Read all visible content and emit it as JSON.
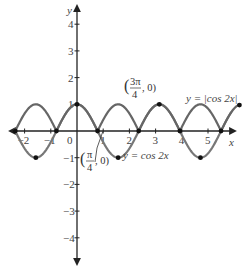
{
  "chart_data": {
    "type": "line",
    "title": "",
    "xlabel": "x",
    "ylabel": "y",
    "xlim": [
      -2.5,
      5.9
    ],
    "ylim": [
      -4.6,
      4.6
    ],
    "x_ticks": [
      -2,
      -1,
      0,
      1,
      2,
      3,
      4,
      5
    ],
    "y_ticks": [
      -4,
      -3,
      -2,
      -1,
      1,
      2,
      3,
      4
    ],
    "grid": false,
    "legend": "none",
    "series": [
      {
        "name": "y = cos 2x",
        "function": "cos(2x)",
        "x_range": [
          -2.4,
          5.9
        ],
        "color": "#777777",
        "marked_points": [
          [
            -3.1416,
            1
          ],
          [
            -1.5708,
            -1
          ],
          [
            0,
            1
          ],
          [
            1.5708,
            -1
          ],
          [
            3.1416,
            1
          ],
          [
            4.7124,
            -1
          ]
        ]
      },
      {
        "name": "y = |cos 2x|",
        "function": "abs(cos(2x))",
        "x_range": [
          -2.4,
          6.2
        ],
        "color": "#666666",
        "marked_points": [
          [
            -2.3562,
            0
          ],
          [
            -0.7854,
            0
          ],
          [
            0.7854,
            0
          ],
          [
            2.3562,
            0
          ],
          [
            3.927,
            0
          ],
          [
            5.4978,
            0
          ],
          [
            6.2,
            0.97
          ]
        ]
      }
    ],
    "annotations": [
      {
        "text": "(3π/4, 0)",
        "num": "3π",
        "den": "4",
        "rest": ", 0)",
        "x": 2.36,
        "y": 1.35
      },
      {
        "text": "(π/4, 0)",
        "num": "π",
        "den": "4",
        "rest": ", 0)",
        "x": 0.5,
        "y": -0.9
      },
      {
        "text": "y = |cos 2x|",
        "x": 4.4,
        "y": 1.1
      },
      {
        "text": "y = cos 2x",
        "x": 2.3,
        "y": -0.6
      }
    ]
  },
  "labels": {
    "x_axis": "x",
    "y_axis": "y",
    "origin": "0",
    "curve_abs": "y = |cos 2x|",
    "curve_cos": "y = cos 2x",
    "ann1_num": "3π",
    "ann1_den": "4",
    "ann1_rest": ", 0)",
    "ann2_num": "π",
    "ann2_den": "4",
    "ann2_rest": ", 0)"
  }
}
